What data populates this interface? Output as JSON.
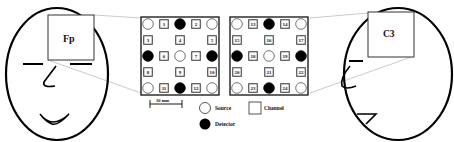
{
  "diagram": {
    "left_head": {
      "view": "front",
      "region_label": "Fp"
    },
    "right_head": {
      "view": "side",
      "region_label": "C3"
    },
    "scale_bar": {
      "label": "30 mm"
    },
    "legend": {
      "source_label": "Source",
      "detector_label": "Detector",
      "channel_label": "Channel"
    },
    "grids": [
      {
        "name": "Fp-probe",
        "rows": [
          [
            {
              "t": "S"
            },
            {
              "t": "C",
              "n": "1"
            },
            {
              "t": "D"
            },
            {
              "t": "C",
              "n": "2"
            },
            {
              "t": "S"
            }
          ],
          [
            {
              "t": "C",
              "n": "3"
            },
            {
              "t": "E"
            },
            {
              "t": "C",
              "n": "4"
            },
            {
              "t": "E"
            },
            {
              "t": "C",
              "n": "5"
            }
          ],
          [
            {
              "t": "D"
            },
            {
              "t": "C",
              "n": "6"
            },
            {
              "t": "S"
            },
            {
              "t": "C",
              "n": "7"
            },
            {
              "t": "D"
            }
          ],
          [
            {
              "t": "C",
              "n": "8"
            },
            {
              "t": "E"
            },
            {
              "t": "C",
              "n": "9"
            },
            {
              "t": "E"
            },
            {
              "t": "C",
              "n": "10"
            }
          ],
          [
            {
              "t": "S"
            },
            {
              "t": "C",
              "n": "11"
            },
            {
              "t": "D"
            },
            {
              "t": "C",
              "n": "12"
            },
            {
              "t": "S"
            }
          ]
        ]
      },
      {
        "name": "C3-probe",
        "rows": [
          [
            {
              "t": "S"
            },
            {
              "t": "C",
              "n": "13"
            },
            {
              "t": "D"
            },
            {
              "t": "C",
              "n": "14"
            },
            {
              "t": "S"
            }
          ],
          [
            {
              "t": "C",
              "n": "15"
            },
            {
              "t": "E"
            },
            {
              "t": "C",
              "n": "16"
            },
            {
              "t": "E"
            },
            {
              "t": "C",
              "n": "17"
            }
          ],
          [
            {
              "t": "D"
            },
            {
              "t": "C",
              "n": "18"
            },
            {
              "t": "S"
            },
            {
              "t": "C",
              "n": "19"
            },
            {
              "t": "D"
            }
          ],
          [
            {
              "t": "C",
              "n": "20"
            },
            {
              "t": "E"
            },
            {
              "t": "C",
              "n": "21"
            },
            {
              "t": "E"
            },
            {
              "t": "C",
              "n": "22"
            }
          ],
          [
            {
              "t": "S"
            },
            {
              "t": "C",
              "n": "23"
            },
            {
              "t": "D"
            },
            {
              "t": "C",
              "n": "24"
            },
            {
              "t": "S"
            }
          ]
        ]
      }
    ]
  }
}
